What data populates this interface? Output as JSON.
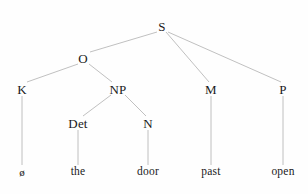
{
  "diagram": {
    "type": "constituency-tree",
    "background_color": "#fefefe",
    "line_color": "#b9b9b9",
    "text_color": "#1a1a1a",
    "nodes": [
      {
        "id": "S",
        "label": "S",
        "x": 162,
        "y": 26,
        "kind": "category"
      },
      {
        "id": "O",
        "label": "O",
        "x": 83,
        "y": 58,
        "kind": "category"
      },
      {
        "id": "K",
        "label": "K",
        "x": 22,
        "y": 89,
        "kind": "category"
      },
      {
        "id": "NP",
        "label": "NP",
        "x": 118,
        "y": 89,
        "kind": "category"
      },
      {
        "id": "M",
        "label": "M",
        "x": 211,
        "y": 89,
        "kind": "category"
      },
      {
        "id": "P",
        "label": "P",
        "x": 283,
        "y": 89,
        "kind": "category"
      },
      {
        "id": "Det",
        "label": "Det",
        "x": 78,
        "y": 123,
        "kind": "category"
      },
      {
        "id": "N",
        "label": "N",
        "x": 148,
        "y": 123,
        "kind": "category"
      },
      {
        "id": "null",
        "label": "ø",
        "x": 22,
        "y": 172,
        "kind": "leaf-null"
      },
      {
        "id": "the",
        "label": "the",
        "x": 78,
        "y": 172,
        "kind": "leaf"
      },
      {
        "id": "door",
        "label": "door",
        "x": 148,
        "y": 172,
        "kind": "leaf"
      },
      {
        "id": "past",
        "label": "past",
        "x": 211,
        "y": 172,
        "kind": "leaf"
      },
      {
        "id": "open",
        "label": "open",
        "x": 283,
        "y": 172,
        "kind": "leaf"
      }
    ],
    "edges": [
      {
        "from": "S",
        "to": "O",
        "x1": 157,
        "y1": 32,
        "x2": 90,
        "y2": 52
      },
      {
        "from": "S",
        "to": "M",
        "x1": 166,
        "y1": 32,
        "x2": 209,
        "y2": 82
      },
      {
        "from": "S",
        "to": "P",
        "x1": 168,
        "y1": 32,
        "x2": 281,
        "y2": 82
      },
      {
        "from": "O",
        "to": "K",
        "x1": 78,
        "y1": 64,
        "x2": 27,
        "y2": 82
      },
      {
        "from": "O",
        "to": "NP",
        "x1": 89,
        "y1": 64,
        "x2": 112,
        "y2": 82
      },
      {
        "from": "NP",
        "to": "Det",
        "x1": 111,
        "y1": 95,
        "x2": 83,
        "y2": 116
      },
      {
        "from": "NP",
        "to": "N",
        "x1": 125,
        "y1": 95,
        "x2": 146,
        "y2": 116
      },
      {
        "from": "K",
        "to": "null",
        "x1": 22,
        "y1": 96,
        "x2": 22,
        "y2": 165
      },
      {
        "from": "Det",
        "to": "the",
        "x1": 78,
        "y1": 130,
        "x2": 78,
        "y2": 165
      },
      {
        "from": "N",
        "to": "door",
        "x1": 148,
        "y1": 130,
        "x2": 148,
        "y2": 165
      },
      {
        "from": "M",
        "to": "past",
        "x1": 211,
        "y1": 96,
        "x2": 211,
        "y2": 165
      },
      {
        "from": "P",
        "to": "open",
        "x1": 283,
        "y1": 96,
        "x2": 283,
        "y2": 165
      }
    ]
  }
}
